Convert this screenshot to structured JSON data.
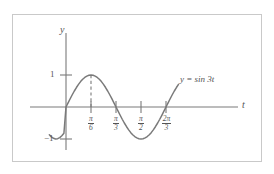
{
  "figure": {
    "background": "#ffffff",
    "frame_color": "#c9c9c9",
    "ink_color": "#7a7a7a",
    "text_color": "#555555"
  },
  "axes": {
    "x_axis_label": "t",
    "y_axis_label": "y"
  },
  "y_ticks": [
    {
      "label": "1",
      "value": 1
    },
    {
      "label": "−1",
      "value": -1
    }
  ],
  "x_ticks": [
    {
      "num": "π",
      "den": "6",
      "value": 0.5235987755982988,
      "label": "π/6"
    },
    {
      "num": "π",
      "den": "3",
      "value": 1.0471975511965976,
      "label": "π/3"
    },
    {
      "num": "π",
      "den": "2",
      "value": 1.5707963267948966,
      "label": "π/2"
    },
    {
      "num": "2π",
      "den": "3",
      "value": 2.0943951023931953,
      "label": "2π/3"
    }
  ],
  "curve": {
    "label": "y = sin 3t",
    "label_parts": {
      "lhs": "y",
      "eq": "=",
      "rhs": "sin 3t"
    }
  },
  "annotations": {
    "peak_dashed_line": "dashed vertical line from peak at t = π/6 down to the t-axis"
  },
  "chart_data": {
    "type": "line",
    "title": "",
    "subtitle": "",
    "xlabel": "t",
    "ylabel": "y",
    "function": "y = sin 3t",
    "grid": false,
    "legend": "none",
    "legend_position": "inline-right",
    "xlim": [
      -0.35,
      2.95
    ],
    "ylim": [
      -1.45,
      1.45
    ],
    "x_tick_values": [
      0.5235987755982988,
      1.0471975511965976,
      1.5707963267948966,
      2.0943951023931953
    ],
    "x_tick_labels": [
      "π/6",
      "π/3",
      "π/2",
      "2π/3"
    ],
    "y_tick_values": [
      -1,
      1
    ],
    "y_tick_labels": [
      "−1",
      "1"
    ],
    "series": [
      {
        "name": "y = sin 3t",
        "color": "#7a7a7a",
        "x": [
          -0.3490658504,
          -0.3054326191,
          -0.2617993878,
          -0.2181661565,
          -0.1745329252,
          -0.1308996939,
          -0.0872664626,
          -0.0436332313,
          0.0,
          0.0436332313,
          0.0872664626,
          0.1308996939,
          0.1745329252,
          0.2181661565,
          0.2617993878,
          0.3054326191,
          0.3490658504,
          0.3926990817,
          0.436332313,
          0.4799655443,
          0.5235987756,
          0.5672320069,
          0.6108652382,
          0.6544984695,
          0.6981317008,
          0.7417649321,
          0.7853981634,
          0.8290313946,
          0.8726646259,
          0.9162978572,
          0.9599310885,
          1.0035643198,
          1.0471975511,
          1.0908307824,
          1.1344640137,
          1.178097245,
          1.2217304763,
          1.2653637076,
          1.3089969389,
          1.3526301702,
          1.3962634015,
          1.4398966328,
          1.4835298641,
          1.5271630954,
          1.5707963267,
          1.614429558,
          1.6580627893,
          1.7016960206,
          1.7453292519,
          1.7889624832,
          1.8325957145,
          1.8762289458,
          1.9198621771,
          1.9634954084,
          2.0071286397,
          2.050761871,
          2.0943951023,
          2.1380283336,
          2.1816615649,
          2.2252947962,
          2.2689280275,
          2.3125612588,
          2.3561944901
        ],
        "y": [
          -0.8660254038,
          -0.9335804265,
          -0.9781476007,
          -0.9972037972,
          -0.9898214419,
          -0.9569403357,
          -0.8987940463,
          -0.8191520443,
          -0.0,
          0.1305261922,
          0.2588190451,
          0.3826834324,
          0.5,
          0.608761429,
          0.7071067812,
          0.7933533403,
          0.8660254038,
          0.9238795325,
          0.9659258263,
          0.9914448614,
          1.0,
          0.9914448614,
          0.9659258263,
          0.9238795325,
          0.8660254038,
          0.7933533403,
          0.7071067812,
          0.608761429,
          0.5,
          0.3826834324,
          0.2588190451,
          0.1305261922,
          0.0,
          -0.1305261922,
          -0.2588190451,
          -0.3826834324,
          -0.5,
          -0.608761429,
          -0.7071067812,
          -0.7933533403,
          -0.8660254038,
          -0.9238795325,
          -0.9659258263,
          -0.9914448614,
          -1.0,
          -0.9914448614,
          -0.9659258263,
          -0.9238795325,
          -0.8660254038,
          -0.7933533403,
          -0.7071067812,
          -0.608761429,
          -0.5,
          -0.3826834324,
          -0.2588190451,
          -0.1305261922,
          0.0,
          0.1305261922,
          0.2588190451,
          0.3826834324,
          0.5,
          0.608761429,
          0.7071067812
        ]
      }
    ],
    "annotations": [
      {
        "type": "vline-dashed",
        "x": 0.5235987755982988,
        "y_from": 0,
        "y_to": 1,
        "label": ""
      },
      {
        "type": "text",
        "x": 2.15,
        "y": 0.72,
        "text": "y = sin 3t"
      }
    ]
  }
}
